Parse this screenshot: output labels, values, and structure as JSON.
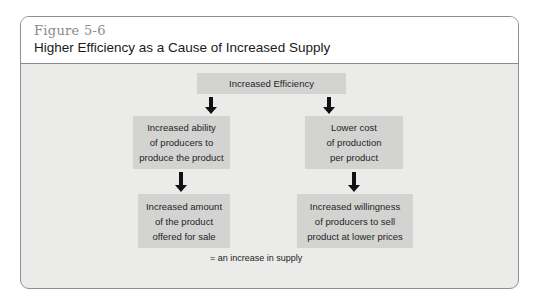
{
  "figure": {
    "number": "Figure 5-6",
    "title": "Higher Efficiency as a Cause of Increased Supply"
  },
  "diagram": {
    "top_node": "Increased Efficiency",
    "left_branch": {
      "middle": "Increased ability\nof producers to\nproduce the product",
      "bottom": "Increased amount\nof the product\noffered for sale"
    },
    "right_branch": {
      "middle": "Lower cost\nof production\nper  product",
      "bottom": "Increased willingness\nof producers to sell\nproduct at lower prices"
    },
    "legend": "= an increase in supply"
  },
  "colors": {
    "box_fill": "#d3d3d2",
    "panel_bg": "#ebebea",
    "arrow": "#111111",
    "figure_number": "#8a8a8a"
  }
}
